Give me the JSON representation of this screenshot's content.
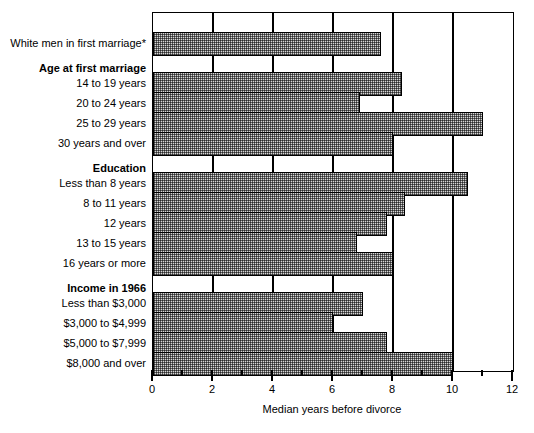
{
  "chart_data": {
    "type": "bar",
    "orientation": "horizontal",
    "title": "",
    "xlabel": "Median years before divorce",
    "ylabel": "",
    "xlim": [
      0,
      12
    ],
    "xticks": [
      0,
      2,
      4,
      6,
      8,
      10,
      12
    ],
    "xtick_labels": [
      "0",
      "2",
      "4",
      "6",
      "8",
      "10",
      "12"
    ],
    "minor_xticks": [
      1,
      3,
      5,
      7,
      9,
      11
    ],
    "grid": true,
    "legend": null,
    "categories": [
      "White men in first marriage*",
      "14 to 19 years",
      "20 to 24 years",
      "25 to 29 years",
      "30 years and over",
      "Less than 8 years",
      "8 to 11 years",
      "12 years",
      "13 to 15 years",
      "16 years or more",
      "Less than $3,000",
      "$3,000 to $4,999",
      "$5,000 to $7,999",
      "$8,000 and over"
    ],
    "values": [
      7.6,
      8.3,
      6.9,
      11.0,
      8.0,
      10.5,
      8.4,
      7.8,
      6.8,
      8.0,
      7.0,
      6.0,
      7.8,
      10.0
    ],
    "group_headings": [
      "Age at first marriage",
      "Education",
      "Income in 1966"
    ]
  },
  "rows": [
    {
      "label": "White men in first marriage*",
      "value": 7.6,
      "kind": "bar",
      "top": 26
    },
    {
      "label": "Age at first marriage",
      "value": null,
      "kind": "heading",
      "top": 68
    },
    {
      "label": "14 to 19 years",
      "value": 8.3,
      "kind": "bar",
      "top": 82
    },
    {
      "label": "20 to 24 years",
      "value": 6.9,
      "kind": "bar",
      "top": 110
    },
    {
      "label": "25 to 29 years",
      "value": 11.0,
      "kind": "bar",
      "top": 138
    },
    {
      "label": "30 years and over",
      "value": 8.0,
      "kind": "bar",
      "top": 166
    },
    {
      "label": "Education",
      "value": null,
      "kind": "heading",
      "top": 208
    },
    {
      "label": "Less than 8 years",
      "value": 10.5,
      "kind": "bar",
      "top": 222
    },
    {
      "label": "8 to 11 years",
      "value": 8.4,
      "kind": "bar",
      "top": 250
    },
    {
      "label": "12 years",
      "value": 7.8,
      "kind": "bar",
      "top": 278
    },
    {
      "label": "13 to 15 years",
      "value": 6.8,
      "kind": "bar",
      "top": 306
    },
    {
      "label": "16 years or more",
      "value": 8.0,
      "kind": "bar",
      "top": 334
    },
    {
      "label": "Income in 1966",
      "value": null,
      "kind": "heading",
      "top": 376
    },
    {
      "label": "Less than $3,000",
      "value": 7.0,
      "kind": "bar",
      "top": 390
    },
    {
      "label": "$3,000 to $4,999",
      "value": 6.0,
      "kind": "bar",
      "top": 418
    },
    {
      "label": "$5,000 to $7,999",
      "value": 7.8,
      "kind": "bar",
      "top": 446
    },
    {
      "label": "$8,000 and over",
      "value": 10.0,
      "kind": "bar",
      "top": 474
    }
  ],
  "colors": {
    "bar_fill": "#d6d6d6",
    "bar_edge": "#000000",
    "axis": "#000000",
    "background": "#ffffff",
    "text": "#000000"
  }
}
